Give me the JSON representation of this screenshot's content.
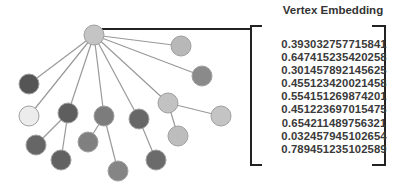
{
  "title": "Vertex Embedding",
  "embedding_values": [
    "0.393032757715841",
    "0.647415235420258",
    "0.301457892145625",
    "0.455123420021458",
    "0.554151269874201",
    "0.451223697015475",
    "0.654211489756321",
    "0.032457945102654",
    "0.789451235102589"
  ],
  "graph": {
    "root": {
      "x": 94,
      "y": 35,
      "color": "#c4c4c4"
    },
    "nodes": [
      {
        "id": "n1",
        "x": 181,
        "y": 46,
        "color": "#b8b8b8"
      },
      {
        "id": "n2",
        "x": 202,
        "y": 76,
        "color": "#8a8a8a"
      },
      {
        "id": "n3",
        "x": 29,
        "y": 84,
        "color": "#555555"
      },
      {
        "id": "n4",
        "x": 29,
        "y": 116,
        "color": "#ececec"
      },
      {
        "id": "n5",
        "x": 68,
        "y": 113,
        "color": "#5e5e5e"
      },
      {
        "id": "n6",
        "x": 104,
        "y": 116,
        "color": "#7c7c7c"
      },
      {
        "id": "n7",
        "x": 139,
        "y": 119,
        "color": "#676767"
      },
      {
        "id": "n8",
        "x": 168,
        "y": 103,
        "color": "#c2c2c2"
      },
      {
        "id": "n9",
        "x": 221,
        "y": 116,
        "color": "#c4c4c4"
      },
      {
        "id": "n10",
        "x": 178,
        "y": 136,
        "color": "#bdbdbd"
      },
      {
        "id": "n11",
        "x": 36,
        "y": 145,
        "color": "#666666"
      },
      {
        "id": "n12",
        "x": 61,
        "y": 160,
        "color": "#626262"
      },
      {
        "id": "n13",
        "x": 88,
        "y": 142,
        "color": "#808080"
      },
      {
        "id": "n14",
        "x": 118,
        "y": 171,
        "color": "#858585"
      },
      {
        "id": "n15",
        "x": 156,
        "y": 160,
        "color": "#6b6b6b"
      }
    ],
    "edges": [
      [
        "root",
        "n1"
      ],
      [
        "root",
        "n2"
      ],
      [
        "root",
        "n3"
      ],
      [
        "root",
        "n4"
      ],
      [
        "root",
        "n5"
      ],
      [
        "root",
        "n6"
      ],
      [
        "root",
        "n7"
      ],
      [
        "root",
        "n8"
      ],
      [
        "n5",
        "n11"
      ],
      [
        "n5",
        "n12"
      ],
      [
        "n6",
        "n13"
      ],
      [
        "n6",
        "n14"
      ],
      [
        "n7",
        "n15"
      ],
      [
        "n8",
        "n9"
      ],
      [
        "n8",
        "n10"
      ]
    ]
  },
  "colors": {
    "edge": "#999999",
    "connector": "#222222",
    "node_stroke": "#a0a0a0",
    "text": "#3a3a3a"
  }
}
